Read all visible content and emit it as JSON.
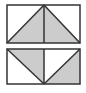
{
  "figure": {
    "colors": {
      "stroke": "#333333",
      "fill_shaded": "#cccccc",
      "background": "#ffffff"
    },
    "top_rectangle": {
      "x": 7,
      "y": 5,
      "width": 73,
      "height": 38,
      "divider_x": 44,
      "shaded_triangles": [
        {
          "points": "7,43 44,5 44,43"
        },
        {
          "points": "44,5 80,43 44,43"
        }
      ]
    },
    "bottom_rectangle": {
      "x": 7,
      "y": 49,
      "width": 73,
      "height": 35,
      "divider_x": 44,
      "shaded_triangles": [
        {
          "points": "7,49 44,49 44,84"
        },
        {
          "points": "44,84 80,49 80,84"
        }
      ]
    }
  }
}
